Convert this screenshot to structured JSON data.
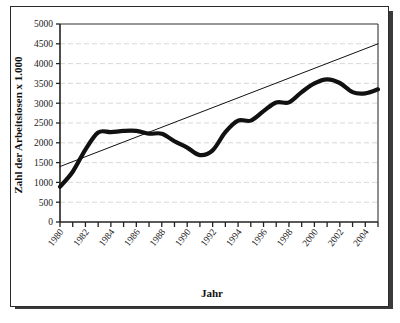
{
  "chart_data": {
    "type": "line",
    "title": "",
    "xlabel": "Jahr",
    "ylabel": "Zahl der Arbeitslosen  x 1.000",
    "xlim": [
      1980,
      2005
    ],
    "ylim": [
      0,
      5000
    ],
    "grid": true,
    "legend_position": "none",
    "x_tick_labels": [
      "1980",
      "1982",
      "1984",
      "1986",
      "1988",
      "1990",
      "1992",
      "1994",
      "1996",
      "1998",
      "2000",
      "2002",
      "2004"
    ],
    "x_tick_values": [
      1980,
      1982,
      1984,
      1986,
      1988,
      1990,
      1992,
      1994,
      1996,
      1998,
      2000,
      2002,
      2004
    ],
    "x_minor_ticks": [
      1980,
      1981,
      1982,
      1983,
      1984,
      1985,
      1986,
      1987,
      1988,
      1989,
      1990,
      1991,
      1992,
      1993,
      1994,
      1995,
      1996,
      1997,
      1998,
      1999,
      2000,
      2001,
      2002,
      2003,
      2004,
      2005
    ],
    "y_tick_labels": [
      "0",
      "500",
      "1000",
      "1500",
      "2000",
      "2500",
      "3000",
      "3500",
      "4000",
      "4500",
      "5000"
    ],
    "y_tick_values": [
      0,
      500,
      1000,
      1500,
      2000,
      2500,
      3000,
      3500,
      4000,
      4500,
      5000
    ],
    "series": [
      {
        "name": "Arbeitslose",
        "color": "#111111",
        "style": "thick-line",
        "x": [
          1980,
          1981,
          1982,
          1983,
          1984,
          1985,
          1986,
          1987,
          1988,
          1989,
          1990,
          1991,
          1992,
          1993,
          1994,
          1995,
          1996,
          1997,
          1998,
          1999,
          2000,
          2001,
          2002,
          2003,
          2004,
          2005
        ],
        "values": [
          890,
          1270,
          1830,
          2260,
          2270,
          2300,
          2300,
          2230,
          2230,
          2040,
          1880,
          1690,
          1810,
          2270,
          2560,
          2560,
          2800,
          3020,
          3020,
          3280,
          3500,
          3600,
          3510,
          3280,
          3250,
          3350
        ]
      },
      {
        "name": "Trendlinie",
        "color": "#111111",
        "style": "thin-line",
        "x": [
          1980,
          2005
        ],
        "values": [
          1400,
          4500
        ]
      }
    ],
    "annotations": [
      {
        "text": "Trendlinie",
        "x": 2053,
        "y": 2860
      }
    ]
  },
  "axes": {
    "y_axis_title": "Zahl der Arbeitslosen  x 1.000",
    "x_axis_title": "Jahr"
  },
  "colors": {
    "frame": "#2b2b2b",
    "shadow": "#3a3a3a",
    "data_line": "#111111",
    "trend_line": "#111111",
    "grid": "#c9c9c9",
    "text": "#111111",
    "background": "#ffffff"
  }
}
